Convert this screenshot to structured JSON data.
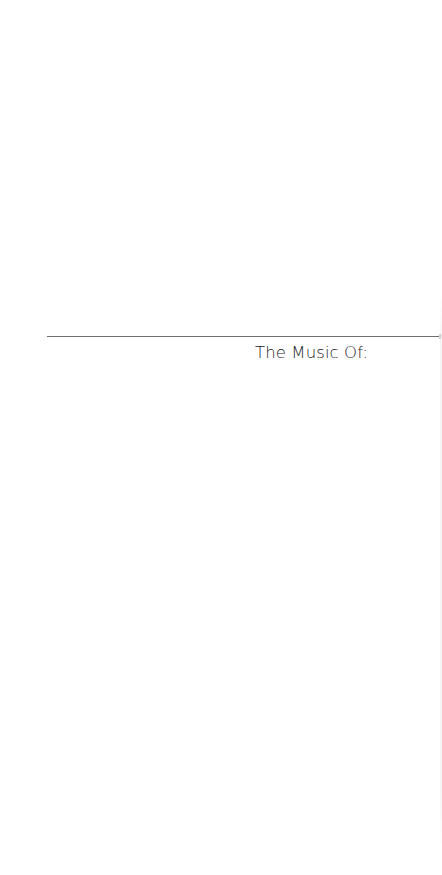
{
  "document": {
    "heading": "The Music Of:",
    "rule": {
      "color": "#6f6f6f"
    },
    "text_color": "#222222",
    "background": "#ffffff"
  }
}
